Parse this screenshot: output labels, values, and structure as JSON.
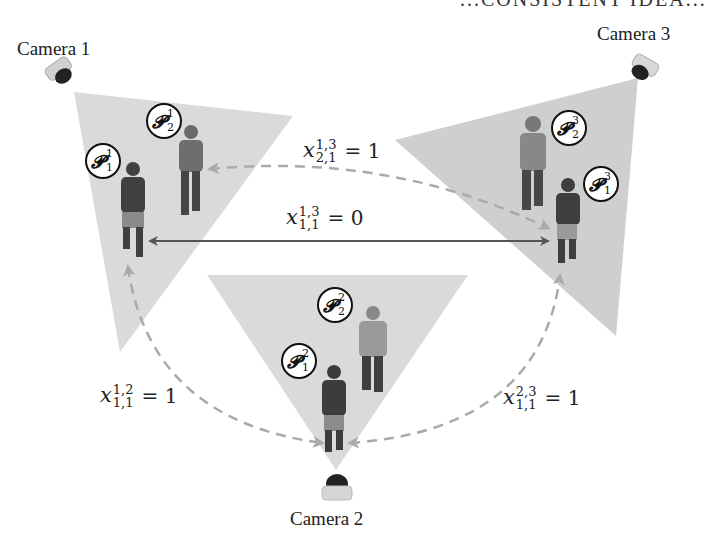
{
  "title_fragment": "...CONSISTENT IDEA...",
  "colors": {
    "fov_fill": "#d9d9d9",
    "solid_arrow": "#555555",
    "dashed_arrow": "#a9a9a9",
    "text": "#222222",
    "person_dark": "#3f3f3f",
    "person_light": "#8a8a8a"
  },
  "cameras": [
    {
      "label": "Camera 1",
      "icon": "dome-camera-icon"
    },
    {
      "label": "Camera 2",
      "icon": "dome-camera-icon"
    },
    {
      "label": "Camera 3",
      "icon": "dome-camera-icon"
    }
  ],
  "persons": {
    "p11": {
      "symbol": "𝓟",
      "sup": "1",
      "sub": "1"
    },
    "p12": {
      "symbol": "𝓟",
      "sup": "1",
      "sub": "2"
    },
    "p21": {
      "symbol": "𝓟",
      "sup": "2",
      "sub": "1"
    },
    "p22": {
      "symbol": "𝓟",
      "sup": "2",
      "sub": "2"
    },
    "p31": {
      "symbol": "𝓟",
      "sup": "3",
      "sub": "1"
    },
    "p32": {
      "symbol": "𝓟",
      "sup": "3",
      "sub": "2"
    }
  },
  "equations": {
    "x13_21": {
      "var": "x",
      "sup": "1,3",
      "sub": "2,1",
      "rhs": "= 1",
      "style": "dashed"
    },
    "x13_11": {
      "var": "x",
      "sup": "1,3",
      "sub": "1,1",
      "rhs": "= 0",
      "style": "solid"
    },
    "x12_11": {
      "var": "x",
      "sup": "1,2",
      "sub": "1,1",
      "rhs": "= 1",
      "style": "dashed"
    },
    "x23_11": {
      "var": "x",
      "sup": "2,3",
      "sub": "1,1",
      "rhs": "= 1",
      "style": "dashed"
    }
  }
}
